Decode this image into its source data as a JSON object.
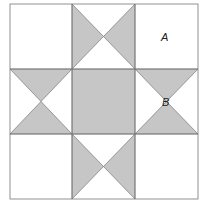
{
  "figure": {
    "type": "quilt-star-pattern",
    "fill_color": "#c6c6c6",
    "line_color": "#555555",
    "labels": [
      {
        "id": "A",
        "text": "A"
      },
      {
        "id": "B",
        "text": "B"
      }
    ]
  }
}
